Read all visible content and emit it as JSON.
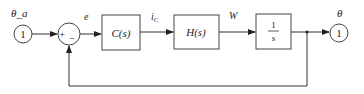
{
  "diagram": {
    "type": "control-block-diagram",
    "input": {
      "label": "θ_a",
      "value": "1"
    },
    "sum_junction": {
      "plus_sign": "+",
      "minus_sign": "−"
    },
    "signals": {
      "error": "e",
      "controller_output_main": "i",
      "controller_output_sub": "C",
      "plant_output": "W",
      "output": "θ"
    },
    "blocks": [
      {
        "id": "controller",
        "label": "C(s)"
      },
      {
        "id": "plant",
        "label": "H(s)"
      },
      {
        "id": "integrator",
        "numerator": "1",
        "denominator": "s"
      }
    ],
    "output": {
      "label": "θ",
      "value": "1"
    },
    "feedback": "unity negative feedback"
  }
}
